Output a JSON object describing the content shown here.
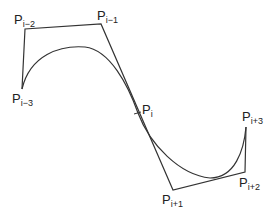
{
  "diagram": {
    "type": "spline-control-polygon",
    "colors": {
      "line": "#333333",
      "curve": "#333333",
      "text": "#222222"
    },
    "points": [
      {
        "id": "p-i-3",
        "base": "P",
        "sub": "i−3",
        "x": 22,
        "y": 89,
        "label_x": 12,
        "label_y": 92
      },
      {
        "id": "p-i-2",
        "base": "P",
        "sub": "i−2",
        "x": 25,
        "y": 29,
        "label_x": 14,
        "label_y": 13
      },
      {
        "id": "p-i-1",
        "base": "P",
        "sub": "i−1",
        "x": 101,
        "y": 24,
        "label_x": 97,
        "label_y": 9
      },
      {
        "id": "p-i",
        "base": "P",
        "sub": "i",
        "x": 138,
        "y": 113,
        "label_x": 142,
        "label_y": 103
      },
      {
        "id": "p-i+1",
        "base": "P",
        "sub": "i+1",
        "x": 173,
        "y": 190,
        "label_x": 162,
        "label_y": 193
      },
      {
        "id": "p-i+2",
        "base": "P",
        "sub": "i+2",
        "x": 245,
        "y": 172,
        "label_x": 239,
        "label_y": 176
      },
      {
        "id": "p-i+3",
        "base": "P",
        "sub": "i+3",
        "x": 246,
        "y": 127,
        "label_x": 242,
        "label_y": 110
      }
    ]
  }
}
